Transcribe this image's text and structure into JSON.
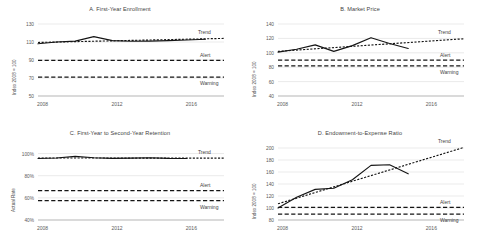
{
  "chart_data": [
    {
      "type": "line",
      "panel": "A",
      "title": "A. First-Year Enrollment",
      "xlabel": "",
      "ylabel": "Index 2008 = 100",
      "xlim": [
        2008,
        2018
      ],
      "ylim": [
        50,
        130
      ],
      "yticks": [
        "130",
        "110",
        "90",
        "70",
        "50"
      ],
      "ytick_values": [
        130,
        110,
        90,
        70,
        50
      ],
      "xticks": [
        "2008",
        "2012",
        "2016"
      ],
      "xtick_values": [
        2008,
        2012,
        2016
      ],
      "grid": true,
      "legend": "inline-annotations",
      "x": [
        2008,
        2009,
        2010,
        2011,
        2012,
        2013,
        2014,
        2015,
        2016,
        2017
      ],
      "series": [
        {
          "name": "Actual",
          "style": "solid",
          "values": [
            108.0,
            110.0,
            111.0,
            116.0,
            111.5,
            110.8,
            111.0,
            111.5,
            112.2,
            113.0
          ]
        },
        {
          "name": "Trend",
          "style": "dotted",
          "x": [
            2008,
            2018
          ],
          "values": [
            109.5,
            114.0
          ]
        }
      ],
      "thresholds": [
        {
          "name": "Alert",
          "value": 89.5,
          "style": "dashed"
        },
        {
          "name": "Warning",
          "value": 71.0,
          "style": "dashed"
        }
      ],
      "annotations": [
        "Trend",
        "Alert",
        "Warning"
      ]
    },
    {
      "type": "line",
      "panel": "B",
      "title": "B. Market Price",
      "xlabel": "",
      "ylabel": "Index  2008 = 100",
      "xlim": [
        2008,
        2018
      ],
      "ylim": [
        40,
        140
      ],
      "yticks": [
        "140",
        "120",
        "100",
        "80",
        "60",
        "40"
      ],
      "ytick_values": [
        140,
        120,
        100,
        80,
        60,
        40
      ],
      "xticks": [
        "2008",
        "2012",
        "2016"
      ],
      "xtick_values": [
        2008,
        2012,
        2016
      ],
      "grid": true,
      "legend": "inline-annotations",
      "x": [
        2008,
        2009,
        2010,
        2011,
        2012,
        2013,
        2014,
        2015
      ],
      "series": [
        {
          "name": "Actual",
          "style": "solid",
          "values": [
            101.0,
            105.0,
            111.0,
            102.0,
            110.0,
            121.0,
            113.0,
            106.0
          ]
        },
        {
          "name": "Trend",
          "style": "dotted",
          "x": [
            2008,
            2018
          ],
          "values": [
            102.0,
            119.5
          ]
        }
      ],
      "thresholds": [
        {
          "name": "Alert",
          "value": 90.0,
          "style": "dashed"
        },
        {
          "name": "Warning",
          "value": 82.0,
          "style": "dashed"
        }
      ],
      "annotations": [
        "Trend",
        "Alert",
        "Warning"
      ]
    },
    {
      "type": "line",
      "panel": "C",
      "title": "C. First-Year to Second-Year Retention",
      "xlabel": "",
      "ylabel": "Actual Rate",
      "xlim": [
        2008,
        2018
      ],
      "ylim": [
        40,
        105
      ],
      "yticks": [
        "100%",
        "80%",
        "60%",
        "40%"
      ],
      "ytick_values": [
        100,
        80,
        60,
        40
      ],
      "xticks": [
        "2008",
        "2012",
        "2016"
      ],
      "xtick_values": [
        2008,
        2012,
        2016
      ],
      "grid": true,
      "legend": "inline-annotations",
      "x": [
        2008,
        2009,
        2010,
        2011,
        2012,
        2013,
        2014,
        2015,
        2016
      ],
      "series": [
        {
          "name": "Actual",
          "style": "solid",
          "values": [
            95.5,
            96.0,
            97.5,
            96.2,
            95.6,
            95.8,
            96.2,
            95.6,
            95.5
          ]
        },
        {
          "name": "Trend",
          "style": "dotted",
          "x": [
            2008,
            2018
          ],
          "values": [
            96.0,
            95.8
          ]
        }
      ],
      "thresholds": [
        {
          "name": "Alert",
          "value": 66.5,
          "style": "dashed"
        },
        {
          "name": "Warning",
          "value": 57.5,
          "style": "dashed"
        }
      ],
      "annotations": [
        "Trend",
        "Alert",
        "Warning"
      ]
    },
    {
      "type": "line",
      "panel": "D",
      "title": "D. Endowment-to-Expense Ratio",
      "xlabel": "",
      "ylabel": "Index 2008 = 100",
      "xlim": [
        2008,
        2018
      ],
      "ylim": [
        80,
        200
      ],
      "yticks": [
        "200",
        "180",
        "160",
        "140",
        "120",
        "100",
        "80"
      ],
      "ytick_values": [
        200,
        180,
        160,
        140,
        120,
        100,
        80
      ],
      "xticks": [
        "2008",
        "2012",
        "2016"
      ],
      "xtick_values": [
        2008,
        2012,
        2016
      ],
      "grid": true,
      "legend": "inline-annotations",
      "x": [
        2008,
        2009,
        2010,
        2011,
        2012,
        2013,
        2014,
        2015
      ],
      "series": [
        {
          "name": "Actual",
          "style": "solid",
          "values": [
            100.0,
            118.0,
            131.0,
            133.0,
            147.0,
            171.0,
            172.0,
            157.0
          ]
        },
        {
          "name": "Trend",
          "style": "dotted",
          "x": [
            2008,
            2018
          ],
          "values": [
            107.0,
            201.0
          ]
        }
      ],
      "thresholds": [
        {
          "name": "Alert",
          "value": 101.0,
          "style": "dashed"
        },
        {
          "name": "Warning",
          "value": 90.0,
          "style": "dashed"
        }
      ],
      "annotations": [
        "Trend",
        "Alert",
        "Warning"
      ]
    }
  ]
}
